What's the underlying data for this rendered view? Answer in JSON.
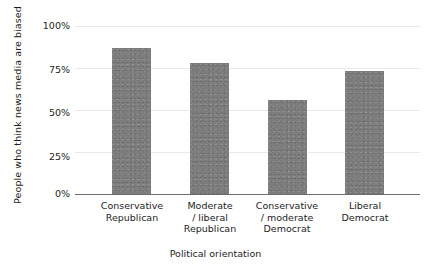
{
  "chart_data": {
    "type": "bar",
    "title": "",
    "subtitle": "",
    "xlabel": "Political orientation",
    "ylabel": "People who think news media are biased",
    "categories": [
      "Conservative Republican",
      "Moderate / liberal Republican",
      "Conservative / moderate Democrat",
      "Liberal Democrat"
    ],
    "category_lines": [
      [
        "Conservative",
        "Republican"
      ],
      [
        "Moderate",
        "/ liberal",
        "Republican"
      ],
      [
        "Conservative",
        "/ moderate",
        "Democrat"
      ],
      [
        "Liberal",
        "Democrat"
      ]
    ],
    "values": [
      87,
      78,
      56,
      73
    ],
    "value_labels": [
      "87%",
      "78%",
      "56%",
      "73%"
    ],
    "ylim": [
      0,
      100
    ],
    "yticks": [
      100,
      75,
      50,
      25,
      0
    ],
    "ytick_labels": [
      "100%",
      "75%",
      "50%",
      "25%",
      "0%"
    ],
    "grid": true,
    "grid_axis": "y",
    "legend": false,
    "legend_position": "none",
    "bar_color": "#7d7d7d",
    "grid_color": "#e9e9e9",
    "axis_color": "#6d6d6d",
    "text_color": "#1d1d1d",
    "background_color": "#ffffff"
  },
  "figure": {
    "plot_left_px": 75,
    "plot_top_px": 26,
    "plot_width_px": 345,
    "plot_height_px": 168
  }
}
